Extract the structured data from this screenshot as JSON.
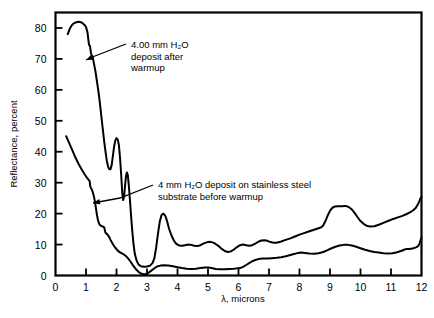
{
  "chart_data": {
    "type": "line",
    "title": "",
    "xlabel": "λ, microns",
    "ylabel": "Reflectance, percent",
    "xlim": [
      0,
      12
    ],
    "ylim": [
      0,
      85
    ],
    "xticks": [
      0,
      1,
      2,
      3,
      4,
      5,
      6,
      7,
      8,
      9,
      10,
      11,
      12
    ],
    "xtick_labels": [
      "0",
      "1",
      "2",
      "3",
      "4",
      "5",
      "6",
      "7",
      "8",
      "9",
      "10",
      "11",
      "12"
    ],
    "yticks": [
      0,
      10,
      20,
      30,
      40,
      50,
      60,
      70,
      80
    ],
    "ytick_labels": [
      "0",
      "10",
      "20",
      "30",
      "40",
      "50",
      "60",
      "70",
      "80"
    ],
    "grid": false,
    "legend": "annotations",
    "series": [
      {
        "name": "4.00 mm H2O deposit after warmup",
        "points": [
          [
            0.4,
            78.0
          ],
          [
            0.48,
            80.0
          ],
          [
            0.56,
            81.2
          ],
          [
            0.66,
            81.8
          ],
          [
            0.76,
            82.0
          ],
          [
            0.86,
            81.8
          ],
          [
            0.95,
            81.0
          ],
          [
            1.0,
            80.3
          ],
          [
            1.05,
            78.5
          ],
          [
            1.08,
            76.0
          ],
          [
            1.1,
            74.5
          ],
          [
            1.13,
            74.2
          ],
          [
            1.16,
            72.0
          ],
          [
            1.19,
            71.0
          ],
          [
            1.22,
            70.8
          ],
          [
            1.25,
            69.0
          ],
          [
            1.28,
            67.5
          ],
          [
            1.31,
            66.0
          ],
          [
            1.34,
            64.0
          ],
          [
            1.37,
            62.0
          ],
          [
            1.4,
            60.0
          ],
          [
            1.44,
            57.0
          ],
          [
            1.48,
            53.5
          ],
          [
            1.52,
            50.0
          ],
          [
            1.56,
            46.5
          ],
          [
            1.6,
            43.0
          ],
          [
            1.64,
            40.0
          ],
          [
            1.68,
            37.2
          ],
          [
            1.72,
            35.3
          ],
          [
            1.76,
            34.4
          ],
          [
            1.8,
            34.3
          ],
          [
            1.84,
            35.6
          ],
          [
            1.88,
            38.5
          ],
          [
            1.92,
            41.6
          ],
          [
            1.96,
            43.6
          ],
          [
            2.0,
            44.4
          ],
          [
            2.04,
            44.0
          ],
          [
            2.08,
            42.0
          ],
          [
            2.12,
            37.5
          ],
          [
            2.16,
            31.5
          ],
          [
            2.19,
            26.5
          ],
          [
            2.22,
            24.4
          ],
          [
            2.25,
            25.5
          ],
          [
            2.28,
            29.0
          ],
          [
            2.31,
            32.0
          ],
          [
            2.34,
            33.3
          ],
          [
            2.37,
            32.5
          ],
          [
            2.4,
            29.5
          ],
          [
            2.44,
            24.5
          ],
          [
            2.48,
            19.0
          ],
          [
            2.52,
            14.0
          ],
          [
            2.56,
            10.0
          ],
          [
            2.6,
            7.0
          ],
          [
            2.66,
            4.8
          ],
          [
            2.72,
            3.6
          ],
          [
            2.8,
            3.0
          ],
          [
            2.9,
            2.8
          ],
          [
            3.0,
            2.9
          ],
          [
            3.1,
            3.2
          ],
          [
            3.18,
            4.0
          ],
          [
            3.24,
            5.5
          ],
          [
            3.3,
            9.0
          ],
          [
            3.36,
            13.5
          ],
          [
            3.42,
            17.5
          ],
          [
            3.48,
            19.6
          ],
          [
            3.54,
            20.0
          ],
          [
            3.6,
            19.3
          ],
          [
            3.66,
            17.5
          ],
          [
            3.72,
            15.2
          ],
          [
            3.8,
            13.0
          ],
          [
            3.88,
            11.3
          ],
          [
            3.96,
            10.2
          ],
          [
            4.05,
            9.7
          ],
          [
            4.15,
            9.6
          ],
          [
            4.25,
            9.8
          ],
          [
            4.35,
            10.0
          ],
          [
            4.45,
            9.9
          ],
          [
            4.55,
            9.6
          ],
          [
            4.65,
            9.5
          ],
          [
            4.75,
            9.8
          ],
          [
            4.85,
            10.3
          ],
          [
            4.95,
            10.7
          ],
          [
            5.05,
            10.9
          ],
          [
            5.15,
            10.7
          ],
          [
            5.25,
            10.2
          ],
          [
            5.35,
            9.5
          ],
          [
            5.45,
            8.6
          ],
          [
            5.55,
            7.9
          ],
          [
            5.65,
            7.6
          ],
          [
            5.75,
            7.8
          ],
          [
            5.85,
            8.4
          ],
          [
            5.95,
            9.2
          ],
          [
            6.05,
            9.8
          ],
          [
            6.15,
            10.0
          ],
          [
            6.25,
            9.8
          ],
          [
            6.35,
            9.6
          ],
          [
            6.45,
            9.8
          ],
          [
            6.55,
            10.3
          ],
          [
            6.65,
            10.9
          ],
          [
            6.75,
            11.3
          ],
          [
            6.85,
            11.4
          ],
          [
            6.95,
            11.2
          ],
          [
            7.05,
            10.8
          ],
          [
            7.15,
            10.6
          ],
          [
            7.25,
            10.6
          ],
          [
            7.4,
            11.0
          ],
          [
            7.55,
            11.5
          ],
          [
            7.7,
            12.0
          ],
          [
            7.85,
            12.6
          ],
          [
            8.0,
            13.2
          ],
          [
            8.15,
            13.7
          ],
          [
            8.3,
            14.2
          ],
          [
            8.45,
            14.7
          ],
          [
            8.6,
            15.2
          ],
          [
            8.7,
            15.5
          ],
          [
            8.78,
            16.2
          ],
          [
            8.85,
            17.6
          ],
          [
            8.92,
            19.3
          ],
          [
            9.0,
            20.9
          ],
          [
            9.08,
            21.9
          ],
          [
            9.16,
            22.3
          ],
          [
            9.26,
            22.4
          ],
          [
            9.38,
            22.4
          ],
          [
            9.5,
            22.5
          ],
          [
            9.6,
            22.2
          ],
          [
            9.7,
            21.5
          ],
          [
            9.8,
            20.3
          ],
          [
            9.9,
            18.9
          ],
          [
            10.0,
            17.6
          ],
          [
            10.1,
            16.7
          ],
          [
            10.2,
            16.1
          ],
          [
            10.32,
            15.8
          ],
          [
            10.45,
            15.9
          ],
          [
            10.6,
            16.4
          ],
          [
            10.75,
            17.0
          ],
          [
            10.9,
            17.6
          ],
          [
            11.05,
            18.2
          ],
          [
            11.2,
            18.7
          ],
          [
            11.35,
            19.2
          ],
          [
            11.5,
            19.8
          ],
          [
            11.62,
            20.4
          ],
          [
            11.72,
            21.0
          ],
          [
            11.8,
            21.7
          ],
          [
            11.86,
            22.6
          ],
          [
            11.92,
            23.8
          ],
          [
            11.97,
            25.0
          ],
          [
            12.0,
            25.4
          ]
        ]
      },
      {
        "name": "4 mm H2O deposit on stainless steel substrate before warmup",
        "points": [
          [
            0.35,
            45.0
          ],
          [
            0.45,
            42.8
          ],
          [
            0.55,
            40.5
          ],
          [
            0.65,
            38.2
          ],
          [
            0.75,
            36.2
          ],
          [
            0.85,
            34.4
          ],
          [
            0.95,
            32.8
          ],
          [
            1.03,
            31.6
          ],
          [
            1.08,
            31.0
          ],
          [
            1.12,
            30.5
          ],
          [
            1.14,
            28.8
          ],
          [
            1.16,
            28.3
          ],
          [
            1.18,
            28.0
          ],
          [
            1.22,
            27.0
          ],
          [
            1.26,
            25.5
          ],
          [
            1.3,
            23.5
          ],
          [
            1.33,
            21.5
          ],
          [
            1.36,
            19.5
          ],
          [
            1.39,
            18.0
          ],
          [
            1.42,
            17.0
          ],
          [
            1.45,
            16.4
          ],
          [
            1.5,
            16.0
          ],
          [
            1.56,
            15.8
          ],
          [
            1.6,
            15.5
          ],
          [
            1.63,
            14.0
          ],
          [
            1.66,
            13.6
          ],
          [
            1.7,
            13.3
          ],
          [
            1.75,
            12.6
          ],
          [
            1.8,
            11.6
          ],
          [
            1.86,
            10.5
          ],
          [
            1.92,
            9.5
          ],
          [
            2.0,
            8.5
          ],
          [
            2.08,
            7.7
          ],
          [
            2.16,
            7.2
          ],
          [
            2.24,
            6.8
          ],
          [
            2.32,
            6.2
          ],
          [
            2.4,
            5.3
          ],
          [
            2.48,
            4.2
          ],
          [
            2.56,
            3.0
          ],
          [
            2.64,
            2.0
          ],
          [
            2.72,
            1.2
          ],
          [
            2.8,
            0.7
          ],
          [
            2.88,
            0.4
          ],
          [
            2.96,
            0.4
          ],
          [
            3.04,
            0.8
          ],
          [
            3.12,
            1.4
          ],
          [
            3.2,
            2.0
          ],
          [
            3.28,
            2.6
          ],
          [
            3.36,
            3.0
          ],
          [
            3.44,
            3.2
          ],
          [
            3.55,
            3.3
          ],
          [
            3.7,
            3.2
          ],
          [
            3.85,
            3.0
          ],
          [
            4.0,
            2.7
          ],
          [
            4.15,
            2.4
          ],
          [
            4.3,
            2.2
          ],
          [
            4.45,
            2.1
          ],
          [
            4.6,
            2.2
          ],
          [
            4.75,
            2.4
          ],
          [
            4.9,
            2.6
          ],
          [
            5.0,
            2.6
          ],
          [
            5.12,
            2.4
          ],
          [
            5.25,
            2.1
          ],
          [
            5.4,
            2.0
          ],
          [
            5.55,
            2.0
          ],
          [
            5.7,
            2.1
          ],
          [
            5.85,
            2.2
          ],
          [
            5.95,
            2.3
          ],
          [
            6.05,
            2.4
          ],
          [
            6.15,
            2.8
          ],
          [
            6.25,
            3.4
          ],
          [
            6.35,
            4.0
          ],
          [
            6.45,
            4.6
          ],
          [
            6.55,
            5.0
          ],
          [
            6.65,
            5.3
          ],
          [
            6.8,
            5.5
          ],
          [
            6.95,
            5.5
          ],
          [
            7.1,
            5.6
          ],
          [
            7.25,
            5.7
          ],
          [
            7.4,
            5.9
          ],
          [
            7.55,
            6.2
          ],
          [
            7.7,
            6.6
          ],
          [
            7.85,
            7.0
          ],
          [
            7.95,
            7.3
          ],
          [
            8.05,
            7.4
          ],
          [
            8.18,
            7.3
          ],
          [
            8.32,
            7.1
          ],
          [
            8.48,
            7.0
          ],
          [
            8.62,
            7.2
          ],
          [
            8.78,
            7.6
          ],
          [
            8.92,
            8.2
          ],
          [
            9.05,
            8.8
          ],
          [
            9.18,
            9.3
          ],
          [
            9.32,
            9.7
          ],
          [
            9.45,
            9.9
          ],
          [
            9.58,
            9.9
          ],
          [
            9.72,
            9.7
          ],
          [
            9.86,
            9.3
          ],
          [
            10.0,
            8.8
          ],
          [
            10.15,
            8.3
          ],
          [
            10.3,
            7.9
          ],
          [
            10.45,
            7.6
          ],
          [
            10.6,
            7.4
          ],
          [
            10.75,
            7.2
          ],
          [
            10.9,
            7.1
          ],
          [
            11.05,
            7.2
          ],
          [
            11.2,
            7.5
          ],
          [
            11.35,
            8.0
          ],
          [
            11.45,
            8.4
          ],
          [
            11.52,
            8.6
          ],
          [
            11.6,
            8.6
          ],
          [
            11.7,
            8.7
          ],
          [
            11.8,
            9.0
          ],
          [
            11.88,
            9.4
          ],
          [
            11.93,
            10.2
          ],
          [
            11.97,
            11.4
          ],
          [
            12.0,
            12.3
          ]
        ]
      }
    ],
    "annotations": [
      {
        "id": "upper-curve-annotation",
        "lines": [
          "4.00 mm H₂O",
          "deposit after",
          "warmup"
        ],
        "text_x": 131,
        "text_y": 48,
        "leader": [
          [
            126,
            44
          ],
          [
            95,
            56
          ],
          [
            86,
            60
          ]
        ],
        "arrow_at": [
          86,
          60
        ]
      },
      {
        "id": "lower-curve-annotation",
        "lines": [
          "4 mm H₂O deposit on stainless steel",
          "substrate before warmup"
        ],
        "text_x": 158,
        "text_y": 188,
        "leader": [
          [
            153,
            185
          ],
          [
            120,
            198
          ],
          [
            93,
            203
          ]
        ],
        "arrow_at": [
          93,
          203
        ]
      }
    ],
    "colors": {
      "curve": "#000000",
      "axis": "#000000",
      "background": "#ffffff"
    }
  }
}
